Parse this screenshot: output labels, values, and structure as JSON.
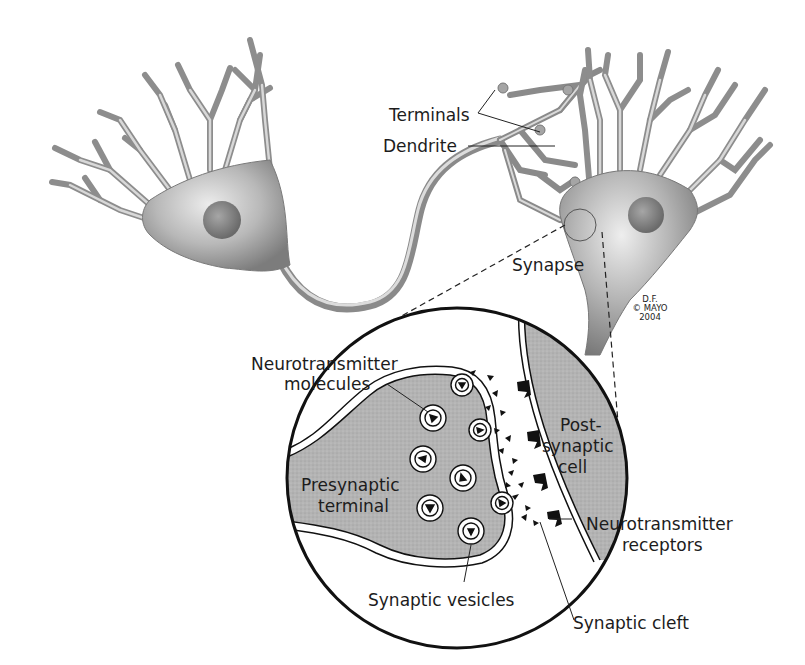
{
  "diagram": {
    "colors": {
      "background": "#ffffff",
      "neuron_fill": "#9a9a9a",
      "neuron_highlight": "#e6e6e6",
      "stipple_fill": "#b4b4b4",
      "ink": "#111111",
      "text": "#1c1c1c"
    },
    "labels": {
      "terminals": "Terminals",
      "dendrite": "Dendrite",
      "synapse": "Synapse",
      "neurotransmitter_molecules_line1": "Neurotransmitter",
      "neurotransmitter_molecules_line2": "molecules",
      "presynaptic_terminal_line1": "Presynaptic",
      "presynaptic_terminal_line2": "terminal",
      "postsynaptic_cell_line1": "Post-",
      "postsynaptic_cell_line2": "synaptic",
      "postsynaptic_cell_line3": "cell",
      "neurotransmitter_receptors_line1": "Neurotransmitter",
      "neurotransmitter_receptors_line2": "receptors",
      "synaptic_vesicles": "Synaptic vesicles",
      "synaptic_cleft": "Synaptic cleft"
    },
    "credit": {
      "line1": "D.F.",
      "line2": "© MAYO",
      "line3": "2004"
    },
    "nodes": [
      {
        "id": "left-neuron",
        "label": "Neuron (presynaptic)"
      },
      {
        "id": "right-neuron",
        "label": "Neuron (postsynaptic)"
      },
      {
        "id": "magnified-synapse",
        "label": "Magnified synapse"
      }
    ],
    "edges": [
      {
        "from": "left-neuron",
        "to": "right-neuron",
        "label": "Axon terminals to dendrite"
      },
      {
        "from": "synapse-circle",
        "to": "magnified-synapse",
        "label": "Zoom callout (dashed)"
      }
    ]
  }
}
